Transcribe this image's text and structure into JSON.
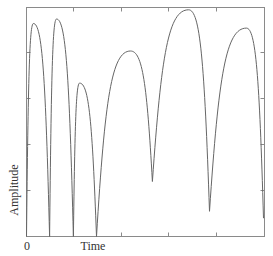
{
  "chart_data": {
    "type": "line",
    "title": "",
    "xlabel": "Time",
    "ylabel": "Amplitude",
    "x_tick_labels": [
      "0"
    ],
    "y_tick_labels": [],
    "xlim": [
      0,
      1
    ],
    "ylim": [
      0,
      1
    ],
    "grid": false,
    "legend": null,
    "frame": "box",
    "line_color": "#666666",
    "series": [
      {
        "name": "amplitude",
        "points": [
          {
            "t": 0.0,
            "a": 0.0
          },
          {
            "t": 0.029,
            "a": 0.93
          },
          {
            "t": 0.097,
            "a": 0.0
          },
          {
            "t": 0.126,
            "a": 0.95
          },
          {
            "t": 0.197,
            "a": 0.0
          },
          {
            "t": 0.223,
            "a": 0.67
          },
          {
            "t": 0.294,
            "a": 0.0
          },
          {
            "t": 0.437,
            "a": 0.81
          },
          {
            "t": 0.529,
            "a": 0.24
          },
          {
            "t": 0.681,
            "a": 0.99
          },
          {
            "t": 0.769,
            "a": 0.11
          },
          {
            "t": 0.924,
            "a": 0.91
          },
          {
            "t": 0.996,
            "a": 0.08
          }
        ]
      }
    ]
  },
  "axes": {
    "x_label": "Time",
    "y_label": "Amplitude",
    "origin_label": "0"
  }
}
